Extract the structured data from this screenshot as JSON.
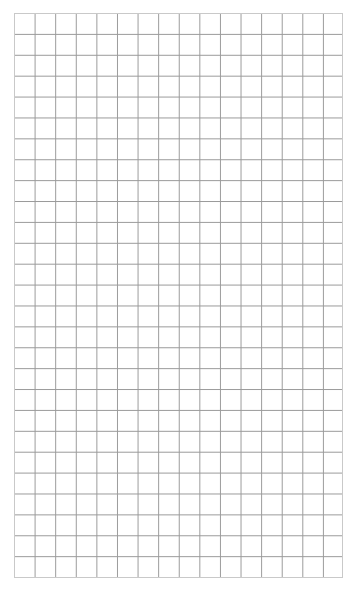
{
  "page": {
    "width": 359,
    "height": 594,
    "background_color": "#ffffff"
  },
  "grid": {
    "x": 14,
    "y": 13,
    "width": 329,
    "height": 565,
    "columns": 16,
    "rows": 27,
    "cell_width": 20.6,
    "cell_height": 20.9,
    "line_color": "#9a9a9a",
    "line_width": 1,
    "border_color": "#c9c9c9",
    "cell_fill_color": "#ffffff"
  },
  "chart_data": {
    "type": "table",
    "title": "",
    "xlabel": "",
    "ylabel": "",
    "columns": 16,
    "rows": 27,
    "categories": [],
    "values": [],
    "grid": true,
    "legend": "none",
    "annotations": []
  }
}
